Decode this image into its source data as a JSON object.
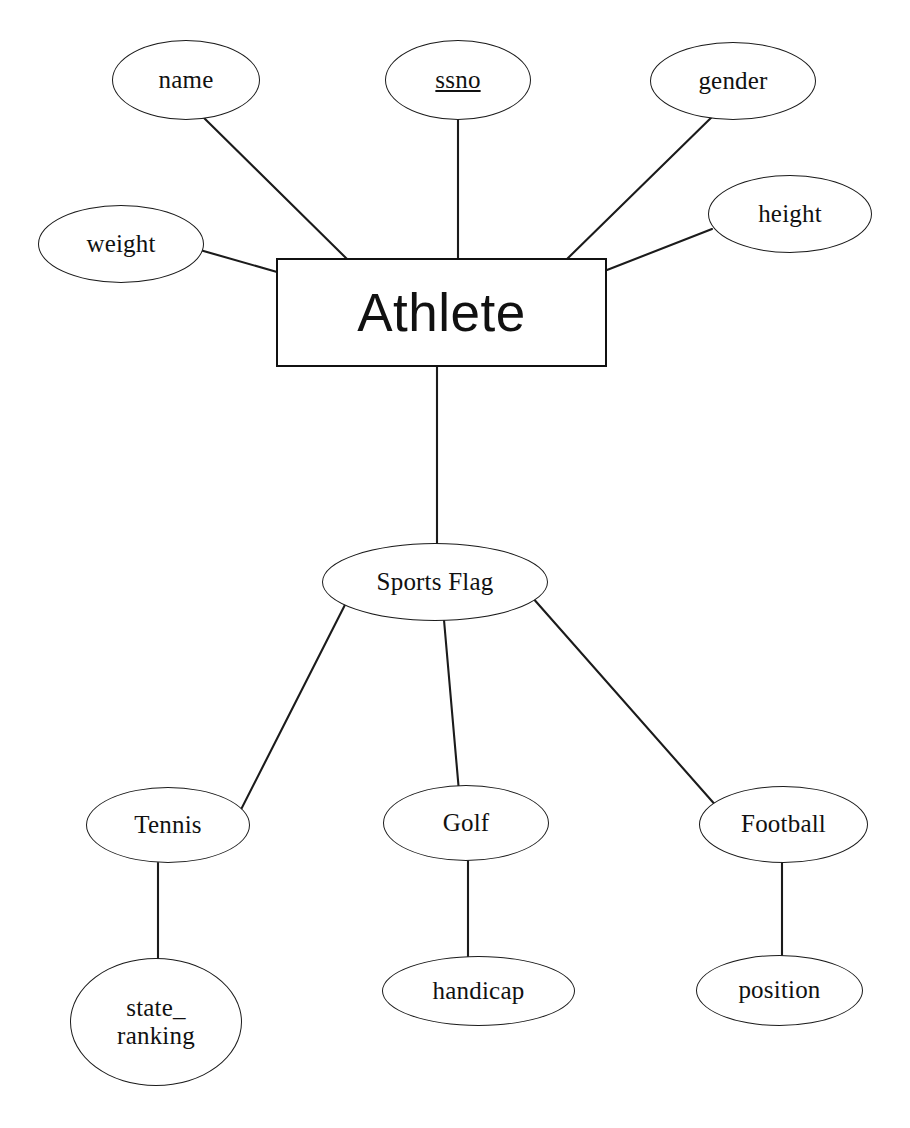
{
  "diagram": {
    "type": "entity-relationship-diagram",
    "background_color": "#ffffff",
    "line_color": "#1b1b1b"
  },
  "entity": {
    "label": "Athlete",
    "shape": "rectangle"
  },
  "attributes": {
    "name": {
      "label": "name",
      "is_key": false
    },
    "ssno": {
      "label": "ssno",
      "is_key": true
    },
    "gender": {
      "label": "gender",
      "is_key": false
    },
    "weight": {
      "label": "weight",
      "is_key": false
    },
    "height": {
      "label": "height",
      "is_key": false
    }
  },
  "discriminator": {
    "label": "Sports Flag"
  },
  "subtypes": {
    "tennis": {
      "label": "Tennis"
    },
    "golf": {
      "label": "Golf"
    },
    "football": {
      "label": "Football"
    }
  },
  "subtype_attributes": {
    "state_ranking": {
      "label": "state_\nranking"
    },
    "handicap": {
      "label": "handicap"
    },
    "position": {
      "label": "position"
    }
  }
}
